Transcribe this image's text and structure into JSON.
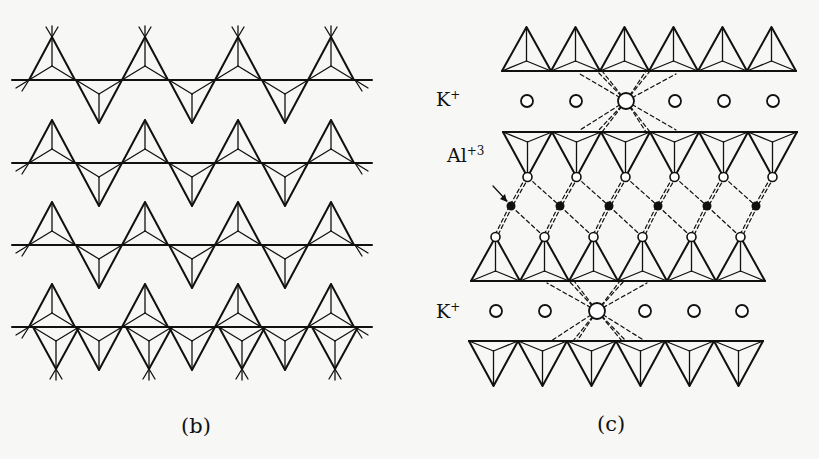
{
  "figure": {
    "panels": [
      {
        "id": "b",
        "caption": "(b)",
        "description": "Plan view of a tetrahedral sheet: corner-sharing tetrahedra arranged in a hexagonal (kagome-like) network along four horizontal rows"
      },
      {
        "id": "c",
        "caption": "(c)",
        "description": "Side view of mica structure: tetrahedral sheets with an octahedral Al layer sandwiched between, and K+ interlayer cations",
        "labels": {
          "k_top": "K+",
          "k_top_base": "K",
          "k_top_charge": "+",
          "al": "Al+3",
          "al_base": "Al",
          "al_charge": "+3",
          "k_bottom": "K+",
          "k_bottom_base": "K",
          "k_bottom_charge": "+"
        }
      }
    ]
  }
}
